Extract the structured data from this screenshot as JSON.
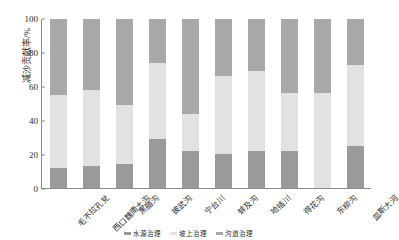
{
  "chart_data": {
    "type": "bar",
    "title": "",
    "xlabel": "",
    "ylabel": "减沙贡献率/%",
    "ylim": [
      0,
      100
    ],
    "yticks": [
      0,
      20,
      40,
      60,
      80,
      100
    ],
    "grid": false,
    "stacked": true,
    "legend_position": "bottom",
    "categories": [
      "毛不拉孔兌",
      "西口魏南大沟",
      "黑艏沟",
      "披武沟",
      "宁台川",
      "蚌及沟",
      "哈插川",
      "得花沟",
      "东柳沟",
      "皿斯大河"
    ],
    "series": [
      {
        "name": "水源治理",
        "color": "#9a9a9a",
        "values": [
          12,
          13,
          14,
          29,
          22,
          20,
          22,
          22,
          0,
          25
        ]
      },
      {
        "name": "坡上治理",
        "color": "#e2e2e2",
        "values": [
          43,
          45,
          35,
          45,
          22,
          46,
          47,
          34,
          56,
          48
        ]
      },
      {
        "name": "沟道治理",
        "color": "#a8a8a8",
        "values": [
          45,
          42,
          51,
          26,
          56,
          34,
          31,
          44,
          44,
          27
        ]
      }
    ]
  },
  "axis": {
    "y_tick_labels": [
      "0",
      "20",
      "40",
      "60",
      "80",
      "100"
    ]
  }
}
